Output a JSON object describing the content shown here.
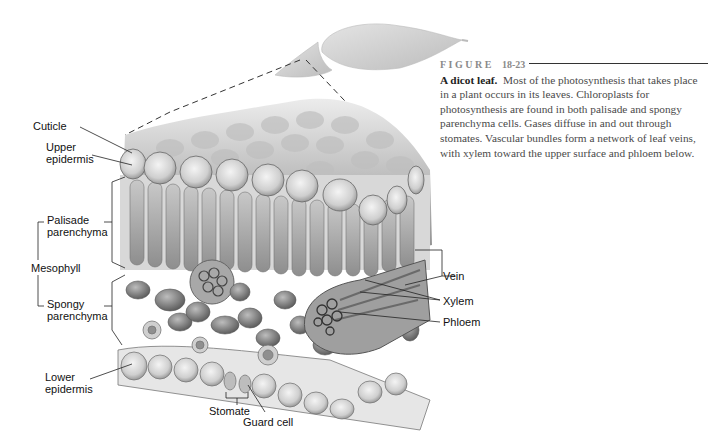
{
  "figure": {
    "label_word": "FIGURE",
    "number": "18-23",
    "title": "A dicot leaf.",
    "caption": "Most of the photosynthesis that takes place in a plant occurs in its leaves. Chloroplasts for photosynthesis are found in both palisade and spongy parenchyma cells. Gases diffuse in and out through stomates. Vascular bundles form a network of leaf veins, with xylem toward the upper surface and phloem below."
  },
  "labels": {
    "cuticle": "Cuticle",
    "upper_epidermis_1": "Upper",
    "upper_epidermis_2": "epidermis",
    "palisade_1": "Palisade",
    "palisade_2": "parenchyma",
    "mesophyll": "Mesophyll",
    "spongy_1": "Spongy",
    "spongy_2": "parenchyma",
    "lower_epidermis_1": "Lower",
    "lower_epidermis_2": "epidermis",
    "stomate": "Stomate",
    "guard_cell": "Guard cell",
    "vein": "Vein",
    "xylem": "Xylem",
    "phloem": "Phloem"
  },
  "colors": {
    "ink": "#111111",
    "caption_text": "#4a4a4a",
    "figure_label": "#8a8a8a"
  }
}
